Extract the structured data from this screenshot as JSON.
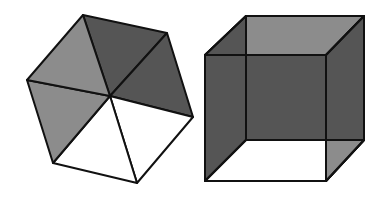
{
  "figure": {
    "colors": {
      "background": "#ffffff",
      "light": "#ffffff",
      "medium": "#8c8c8c",
      "dark": "#555555",
      "stroke": "#111111"
    },
    "hexagon": {
      "center": [
        110,
        96
      ],
      "vertices": [
        [
          83,
          15
        ],
        [
          167,
          33
        ],
        [
          193,
          117
        ],
        [
          137,
          183
        ],
        [
          53,
          163
        ],
        [
          27,
          80
        ]
      ],
      "triangle_fills": [
        "dark",
        "dark",
        "light",
        "light",
        "medium",
        "medium"
      ]
    },
    "cube": {
      "back_square": [
        [
          246,
          16
        ],
        [
          364,
          16
        ],
        [
          364,
          140
        ],
        [
          246,
          140
        ]
      ],
      "front_square": [
        [
          205,
          55
        ],
        [
          326,
          55
        ],
        [
          326,
          181
        ],
        [
          205,
          181
        ]
      ]
    }
  }
}
